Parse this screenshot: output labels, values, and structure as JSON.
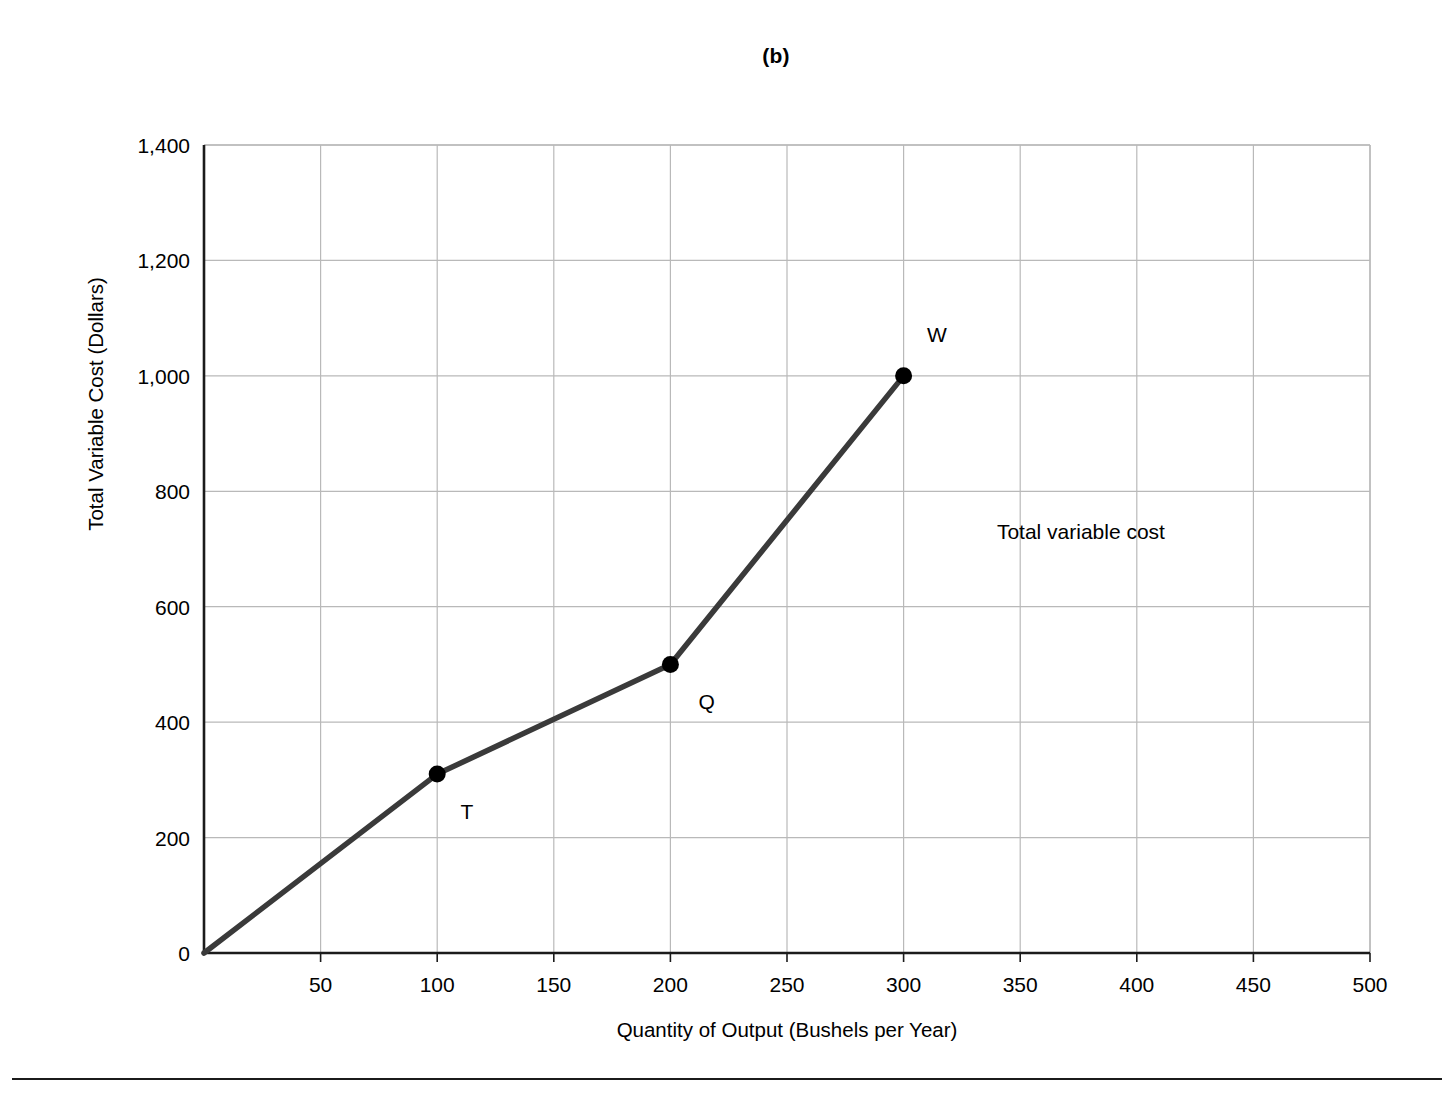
{
  "figure": {
    "title": "(b)",
    "background": "#ffffff",
    "line_color": "#3a3a3a",
    "grid_color": "#b9b9b9",
    "axis_color": "#1b1b1b"
  },
  "chart_data": {
    "type": "line",
    "title": "(b)",
    "xlabel": "Quantity of Output (Bushels per Year)",
    "ylabel": "Total Variable Cost (Dollars)",
    "xlim": [
      0,
      500
    ],
    "ylim": [
      0,
      1400
    ],
    "xticks": [
      0,
      50,
      100,
      150,
      200,
      250,
      300,
      350,
      400,
      450,
      500
    ],
    "xtick_labels": [
      "",
      "50",
      "100",
      "150",
      "200",
      "250",
      "300",
      "350",
      "400",
      "450",
      "500"
    ],
    "yticks": [
      0,
      200,
      400,
      600,
      800,
      1000,
      1200,
      1400
    ],
    "ytick_labels": [
      "0",
      "200",
      "400",
      "600",
      "800",
      "1,000",
      "1,200",
      "1,400"
    ],
    "grid": true,
    "legend": "none",
    "series": [
      {
        "name": "Total variable cost",
        "x": [
          0,
          100,
          200,
          300
        ],
        "values": [
          0,
          310,
          500,
          1000
        ],
        "marker_points": [
          {
            "label": "T",
            "x": 100,
            "y": 310
          },
          {
            "label": "Q",
            "x": 200,
            "y": 500
          },
          {
            "label": "W",
            "x": 300,
            "y": 1000
          }
        ]
      }
    ],
    "annotations": [
      {
        "text": "Total variable cost",
        "x": 340,
        "y": 730
      },
      {
        "text": "T",
        "x": 110,
        "y": 245
      },
      {
        "text": "Q",
        "x": 212,
        "y": 435
      },
      {
        "text": "W",
        "x": 310,
        "y": 1070
      }
    ]
  }
}
